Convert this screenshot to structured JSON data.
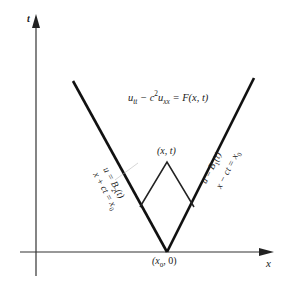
{
  "figure": {
    "background": "#ffffff",
    "ink_color": "#1a1a1a",
    "axes": {
      "t_axis_label": "t",
      "x_axis_label": "x"
    },
    "equation": {
      "u": "u",
      "tt": "tt",
      "minus": " − c",
      "sq": "2",
      "u2": "u",
      "xx": "xx",
      "rhs": " = F(x, t)"
    },
    "apex_label": "(x, t)",
    "origin_label": {
      "open": "(x",
      "sub": "0",
      "close": ", 0)"
    },
    "left_characteristic": {
      "boundary_condition": {
        "lhs": "u = B",
        "sub": "2",
        "rhs": "(t)"
      },
      "line_equation": {
        "lhs": "x + ct = x",
        "sub": "0"
      }
    },
    "right_characteristic": {
      "boundary_condition": {
        "lhs": "u = B",
        "sub": "1",
        "rhs": "(t)"
      },
      "line_equation": {
        "lhs": "x − ct = x",
        "sub": "0"
      }
    }
  }
}
